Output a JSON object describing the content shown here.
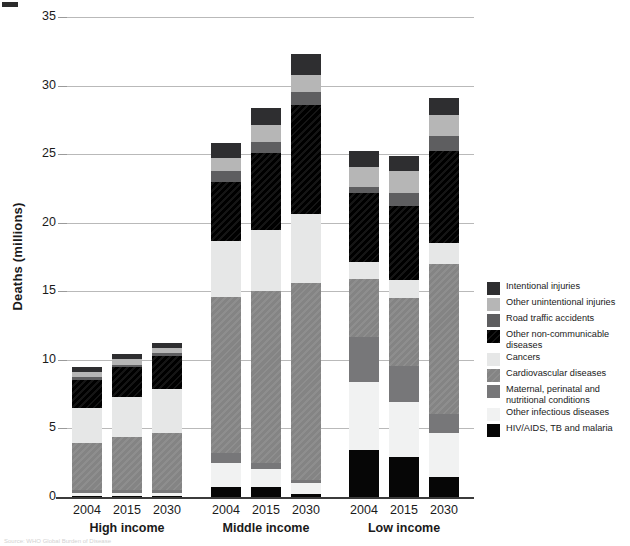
{
  "axis": {
    "ylabel": "Deaths (millions)",
    "yticks": [
      0,
      5,
      10,
      15,
      20,
      25,
      30,
      35
    ],
    "ymax": 35
  },
  "legend": [
    {
      "key": "intentional",
      "label": "Intentional injuries",
      "color": "#2e2e30"
    },
    {
      "key": "otherunint",
      "label": "Other unintentional injuries",
      "color": "#b6b6b6"
    },
    {
      "key": "road",
      "label": "Road traffic accidents",
      "color": "#5e5e60"
    },
    {
      "key": "noncomm",
      "label": "Other non-communicable diseases",
      "color": "#101010"
    },
    {
      "key": "cancers",
      "label": "Cancers",
      "color": "#e6e7e7"
    },
    {
      "key": "cardio",
      "label": "Cardiovascular diseases",
      "color": "#8a8a8a"
    },
    {
      "key": "maternal",
      "label": "Maternal, perinatal and nutritional conditions",
      "color": "#777779"
    },
    {
      "key": "otherinf",
      "label": "Other infectious diseases",
      "color": "#f1f2f2"
    },
    {
      "key": "hiv",
      "label": "HIV/AIDS, TB and malaria",
      "color": "#060606"
    }
  ],
  "groups": [
    {
      "name": "High income",
      "years": [
        "2004",
        "2015",
        "2030"
      ]
    },
    {
      "name": "Middle income",
      "years": [
        "2004",
        "2015",
        "2030"
      ]
    },
    {
      "name": "Low income",
      "years": [
        "2004",
        "2015",
        "2030"
      ]
    }
  ],
  "source": "Source: WHO Global Burden of Disease",
  "chart_data": {
    "type": "bar",
    "title": "",
    "xlabel": "",
    "ylabel": "Deaths (millions)",
    "ylim": [
      0,
      35
    ],
    "grid": true,
    "stacked": true,
    "legend_position": "right",
    "categories": [
      "High income 2004",
      "High income 2015",
      "High income 2030",
      "Middle income 2004",
      "Middle income 2015",
      "Middle income 2030",
      "Low income 2004",
      "Low income 2015",
      "Low income 2030"
    ],
    "series": [
      {
        "name": "HIV/AIDS, TB and malaria",
        "values": [
          0.05,
          0.05,
          0.05,
          0.75,
          0.7,
          0.25,
          3.45,
          2.9,
          1.45
        ]
      },
      {
        "name": "Other infectious diseases",
        "values": [
          0.25,
          0.25,
          0.25,
          1.75,
          1.35,
          0.75,
          4.9,
          4.05,
          3.25
        ]
      },
      {
        "name": "Maternal, perinatal and nutritional conditions",
        "values": [
          0.2,
          0.2,
          0.2,
          0.7,
          0.45,
          0.25,
          3.3,
          2.6,
          1.35
        ]
      },
      {
        "name": "Cardiovascular diseases",
        "values": [
          3.45,
          3.85,
          4.2,
          11.35,
          12.55,
          14.35,
          4.25,
          4.95,
          10.95
        ]
      },
      {
        "name": "Cancers",
        "values": [
          2.55,
          2.95,
          3.2,
          4.15,
          4.45,
          5.05,
          1.25,
          1.3,
          1.55
        ]
      },
      {
        "name": "Other non-communicable diseases",
        "values": [
          2.05,
          2.15,
          2.4,
          4.3,
          5.6,
          7.95,
          5.05,
          5.45,
          6.7
        ]
      },
      {
        "name": "Road traffic accidents",
        "values": [
          0.2,
          0.2,
          0.2,
          0.75,
          0.8,
          0.95,
          0.4,
          0.95,
          1.05
        ]
      },
      {
        "name": "Other unintentional injuries",
        "values": [
          0.4,
          0.4,
          0.4,
          1.0,
          1.2,
          1.25,
          1.45,
          1.55,
          1.55
        ]
      },
      {
        "name": "Intentional injuries",
        "values": [
          0.35,
          0.35,
          0.35,
          1.05,
          1.25,
          1.5,
          1.15,
          1.15,
          1.25
        ]
      }
    ],
    "totals": [
      9.5,
      10.4,
      11.25,
      25.8,
      28.35,
      32.3,
      25.2,
      24.9,
      29.1
    ],
    "group_labels": [
      "High income",
      "Middle income",
      "Low income"
    ],
    "year_labels": [
      "2004",
      "2015",
      "2030"
    ]
  }
}
